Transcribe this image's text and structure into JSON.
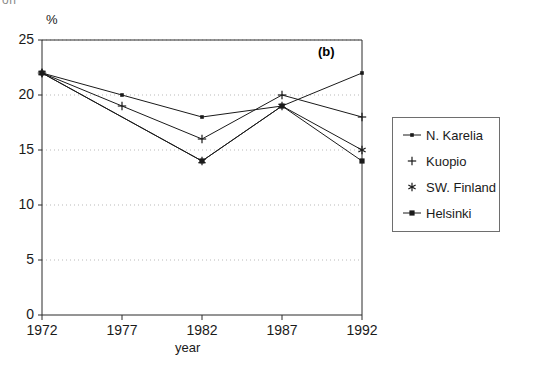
{
  "figure": {
    "panel_label": "(b)",
    "clipped_top_text": "on",
    "unit_label": "%",
    "xaxis_title": "year"
  },
  "chart_data": {
    "type": "line",
    "title": "",
    "subtitle": "",
    "panel": "(b)",
    "xlabel": "year",
    "ylabel": "%",
    "categories": [
      "1972",
      "1977",
      "1982",
      "1987",
      "1992"
    ],
    "x": [
      1972,
      1977,
      1982,
      1987,
      1992
    ],
    "xlim": [
      1972,
      1992
    ],
    "ylim": [
      0,
      25
    ],
    "yticks": [
      0,
      5,
      10,
      15,
      20,
      25
    ],
    "ytick_labels": [
      "0",
      "5",
      "10",
      "15",
      "20",
      "25"
    ],
    "grid": "horizontal-dotted",
    "legend_position": "right-outside",
    "series": [
      {
        "name": "N. Karelia",
        "marker": "dot",
        "color": "#1a1a1a",
        "values": [
          22,
          20,
          18,
          19,
          22
        ]
      },
      {
        "name": "Kuopio",
        "marker": "plus",
        "color": "#1a1a1a",
        "values": [
          22,
          19,
          16,
          20,
          18
        ]
      },
      {
        "name": "SW. Finland",
        "marker": "asterisk",
        "color": "#1a1a1a",
        "values": [
          22,
          null,
          14,
          19,
          15
        ]
      },
      {
        "name": "Helsinki",
        "marker": "square",
        "color": "#1a1a1a",
        "values": [
          22,
          null,
          14,
          19,
          14
        ]
      }
    ]
  },
  "legend": {
    "items": [
      {
        "label": "N. Karelia",
        "marker": "dot"
      },
      {
        "label": "Kuopio",
        "marker": "plus"
      },
      {
        "label": "SW. Finland",
        "marker": "asterisk"
      },
      {
        "label": "Helsinki",
        "marker": "square"
      }
    ]
  }
}
